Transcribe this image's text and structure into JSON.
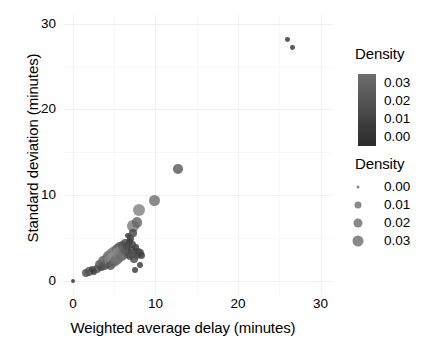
{
  "chart_data": {
    "type": "scatter",
    "title": "",
    "xlabel": "Weighted average delay (minutes)",
    "ylabel": "Standard deviation (minutes)",
    "xlim": [
      -1.2,
      31.5
    ],
    "ylim": [
      -1.6,
      31.0
    ],
    "xticks": [
      0,
      10,
      20,
      30
    ],
    "yticks": [
      0,
      10,
      20,
      30
    ],
    "xticklabels": [
      "0",
      "10",
      "20",
      "30"
    ],
    "yticklabels": [
      "0",
      "10",
      "20",
      "30"
    ],
    "grid": true,
    "legend_position": "right",
    "size_encodes": "Density",
    "color_encodes": "Density",
    "points": [
      {
        "x": 0.05,
        "y": 0.05,
        "d": 0.001
      },
      {
        "x": 1.55,
        "y": 0.95,
        "d": 0.01
      },
      {
        "x": 1.95,
        "y": 1.1,
        "d": 0.012
      },
      {
        "x": 2.35,
        "y": 1.35,
        "d": 0.006
      },
      {
        "x": 2.6,
        "y": 1.1,
        "d": 0.004
      },
      {
        "x": 2.95,
        "y": 1.45,
        "d": 0.009
      },
      {
        "x": 3.25,
        "y": 1.95,
        "d": 0.013
      },
      {
        "x": 3.45,
        "y": 1.6,
        "d": 0.008
      },
      {
        "x": 3.7,
        "y": 2.3,
        "d": 0.017
      },
      {
        "x": 3.85,
        "y": 1.8,
        "d": 0.011
      },
      {
        "x": 4.05,
        "y": 2.55,
        "d": 0.021
      },
      {
        "x": 4.2,
        "y": 2.1,
        "d": 0.014
      },
      {
        "x": 4.35,
        "y": 2.95,
        "d": 0.019
      },
      {
        "x": 4.5,
        "y": 2.45,
        "d": 0.026
      },
      {
        "x": 4.6,
        "y": 1.85,
        "d": 0.012
      },
      {
        "x": 4.75,
        "y": 3.15,
        "d": 0.023
      },
      {
        "x": 4.85,
        "y": 2.7,
        "d": 0.028
      },
      {
        "x": 4.95,
        "y": 2.25,
        "d": 0.016
      },
      {
        "x": 5.05,
        "y": 3.45,
        "d": 0.024
      },
      {
        "x": 5.15,
        "y": 2.95,
        "d": 0.03
      },
      {
        "x": 5.25,
        "y": 2.5,
        "d": 0.02
      },
      {
        "x": 5.35,
        "y": 3.7,
        "d": 0.018
      },
      {
        "x": 5.45,
        "y": 3.2,
        "d": 0.029
      },
      {
        "x": 5.55,
        "y": 2.75,
        "d": 0.022
      },
      {
        "x": 5.65,
        "y": 3.95,
        "d": 0.015
      },
      {
        "x": 5.75,
        "y": 3.4,
        "d": 0.027
      },
      {
        "x": 5.85,
        "y": 2.95,
        "d": 0.019
      },
      {
        "x": 5.95,
        "y": 3.65,
        "d": 0.025
      },
      {
        "x": 6.05,
        "y": 4.15,
        "d": 0.013
      },
      {
        "x": 6.15,
        "y": 3.2,
        "d": 0.021
      },
      {
        "x": 6.25,
        "y": 3.85,
        "d": 0.017
      },
      {
        "x": 6.35,
        "y": 4.45,
        "d": 0.011
      },
      {
        "x": 6.45,
        "y": 3.5,
        "d": 0.015
      },
      {
        "x": 6.55,
        "y": 4.1,
        "d": 0.009
      },
      {
        "x": 6.7,
        "y": 3.25,
        "d": 0.013
      },
      {
        "x": 6.85,
        "y": 4.65,
        "d": 0.007
      },
      {
        "x": 6.95,
        "y": 2.95,
        "d": 0.01
      },
      {
        "x": 7.1,
        "y": 3.6,
        "d": 0.008
      },
      {
        "x": 7.25,
        "y": 4.3,
        "d": 0.006
      },
      {
        "x": 7.35,
        "y": 2.55,
        "d": 0.009
      },
      {
        "x": 7.5,
        "y": 3.3,
        "d": 0.012
      },
      {
        "x": 7.65,
        "y": 3.95,
        "d": 0.005
      },
      {
        "x": 7.8,
        "y": 3.05,
        "d": 0.01
      },
      {
        "x": 7.95,
        "y": 3.5,
        "d": 0.007
      },
      {
        "x": 8.15,
        "y": 3.25,
        "d": 0.009
      },
      {
        "x": 8.35,
        "y": 3.0,
        "d": 0.006
      },
      {
        "x": 7.55,
        "y": 1.35,
        "d": 0.004
      },
      {
        "x": 8.1,
        "y": 1.9,
        "d": 0.004
      },
      {
        "x": 6.65,
        "y": 5.35,
        "d": 0.003
      },
      {
        "x": 6.95,
        "y": 4.95,
        "d": 0.005
      },
      {
        "x": 7.25,
        "y": 6.4,
        "d": 0.024
      },
      {
        "x": 7.3,
        "y": 5.65,
        "d": 0.008
      },
      {
        "x": 8.05,
        "y": 8.25,
        "d": 0.026
      },
      {
        "x": 7.75,
        "y": 6.85,
        "d": 0.018
      },
      {
        "x": 9.9,
        "y": 9.45,
        "d": 0.021
      },
      {
        "x": 12.75,
        "y": 13.05,
        "d": 0.014
      },
      {
        "x": 25.95,
        "y": 28.1,
        "d": 0.002
      },
      {
        "x": 26.55,
        "y": 27.25,
        "d": 0.002
      }
    ]
  },
  "legends": {
    "color": {
      "title": "Density",
      "labels": [
        "0.03",
        "0.02",
        "0.01",
        "0.00"
      ],
      "values": [
        0.03,
        0.02,
        0.01,
        0.0
      ],
      "gradient_top": "#6e6e6e",
      "gradient_bottom": "#2c2c2c"
    },
    "size": {
      "title": "Density",
      "items": [
        {
          "label": "0.00",
          "value": 0.0,
          "diameter_px": 3
        },
        {
          "label": "0.01",
          "value": 0.01,
          "diameter_px": 7
        },
        {
          "label": "0.02",
          "value": 0.02,
          "diameter_px": 9
        },
        {
          "label": "0.03",
          "value": 0.03,
          "diameter_px": 11
        }
      ],
      "dot_color": "#8a8a8a"
    }
  }
}
